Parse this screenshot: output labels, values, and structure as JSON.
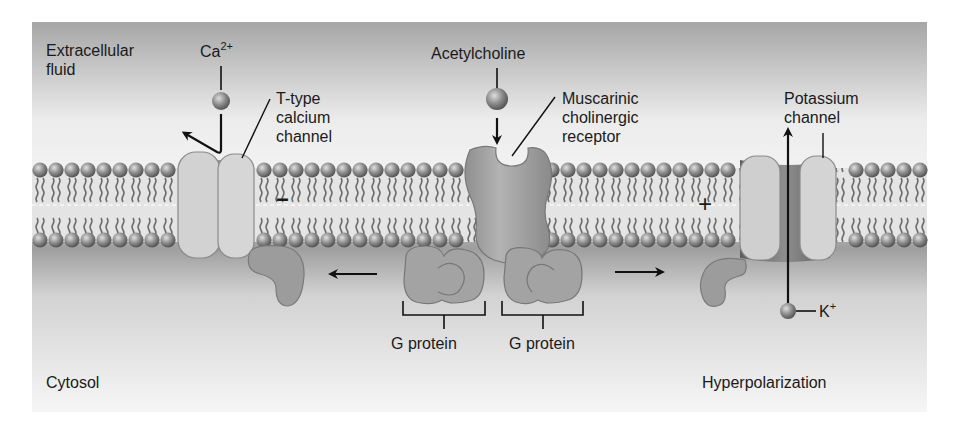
{
  "figure": {
    "type": "membrane-signaling-diagram",
    "regions": {
      "extracellular": "Extracellular\nfluid",
      "cytosol": "Cytosol"
    },
    "molecules": {
      "calcium": {
        "base": "Ca",
        "charge": "2+"
      },
      "acetylcholine": "Acetylcholine",
      "potassium": {
        "base": "K",
        "charge": "+"
      }
    },
    "proteins": {
      "t_type_channel": "T-type\ncalcium\nchannel",
      "muscarinic_receptor": "Muscarinic\ncholinergic\nreceptor",
      "potassium_channel": "Potassium\nchannel",
      "g_protein_left": "G protein",
      "g_protein_right": "G protein"
    },
    "charges": {
      "left_membrane": "−",
      "right_membrane": "+"
    },
    "outcome": "Hyperpolarization",
    "colors": {
      "panel_top": "#a9a9a9",
      "panel_mid": "#f1f1f1",
      "membrane_core": "#e6e6e6",
      "head": "#8c8c8c",
      "protein_light": "#cfcfcf",
      "protein_mid": "#a8a8a8",
      "protein_dark": "#8a8a8a",
      "ink": "#111111"
    }
  }
}
